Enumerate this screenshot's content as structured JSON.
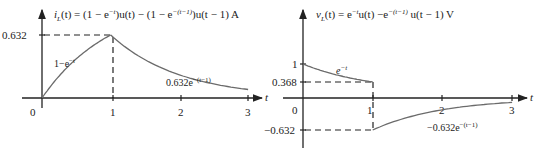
{
  "plots": [
    {
      "title": "i_L(t) = (1 − e^−t)u(t) − (1 − e^−(t−1))u(t − 1) A",
      "title_parts": [
        "i",
        "L",
        "(t) = (1 − e",
        "−t",
        ")u(t) − (1 − e",
        "−(t−1)",
        ")u(t − 1) A"
      ],
      "xlabel": "t",
      "xticks": [
        "0",
        "1",
        "2",
        "3"
      ],
      "yticks": [
        "0.632"
      ],
      "annotations": {
        "rise": [
          "1−e",
          "−t"
        ],
        "decay": [
          "0.632e",
          "−(t−1)"
        ]
      }
    },
    {
      "title": "v_L(t) = e^−t u(t) − e^−(t−1) u(t − 1) V",
      "title_parts": [
        "v",
        "L",
        "(t) = e",
        "−t",
        "u(t) −e",
        "−(t−1)",
        " u(t − 1) V"
      ],
      "xlabel": "t",
      "xticks": [
        "0",
        "1",
        "2",
        "3"
      ],
      "yticks": [
        "1",
        "0.368",
        "−0.632"
      ],
      "annotations": {
        "decay": [
          "e",
          "−t"
        ],
        "neg": [
          "−0.632e",
          "−(t−1)"
        ]
      }
    }
  ],
  "chart_data": [
    {
      "type": "line",
      "title": "i_L(t) = (1 − e^−t)u(t) − (1 − e^−(t−1))u(t − 1) A",
      "xlabel": "t",
      "ylabel": "i_L(t)",
      "xlim": [
        0,
        3
      ],
      "ylim": [
        0,
        0.7
      ],
      "series": [
        {
          "name": "1−e^−t",
          "x": [
            0,
            0.25,
            0.5,
            0.75,
            1
          ],
          "y": [
            0,
            0.221,
            0.393,
            0.528,
            0.632
          ]
        },
        {
          "name": "0.632e^−(t−1)",
          "x": [
            1,
            1.5,
            2,
            2.5,
            3
          ],
          "y": [
            0.632,
            0.383,
            0.233,
            0.141,
            0.086
          ]
        }
      ],
      "marked_values": [
        {
          "t": 1,
          "value": 0.632
        }
      ]
    },
    {
      "type": "line",
      "title": "v_L(t) = e^−t u(t) − e^−(t−1) u(t − 1) V",
      "xlabel": "t",
      "ylabel": "v_L(t)",
      "xlim": [
        0,
        3
      ],
      "ylim": [
        -0.632,
        1
      ],
      "series": [
        {
          "name": "e^−t",
          "x": [
            0,
            0.25,
            0.5,
            0.75,
            1
          ],
          "y": [
            1,
            0.779,
            0.607,
            0.472,
            0.368
          ]
        },
        {
          "name": "−0.632e^−(t−1)",
          "x": [
            1,
            1.5,
            2,
            2.5,
            3
          ],
          "y": [
            -0.632,
            -0.383,
            -0.233,
            -0.141,
            -0.086
          ]
        }
      ],
      "marked_values": [
        {
          "t": 1,
          "value": 0.368
        },
        {
          "t": 1,
          "value": -0.632
        }
      ]
    }
  ]
}
